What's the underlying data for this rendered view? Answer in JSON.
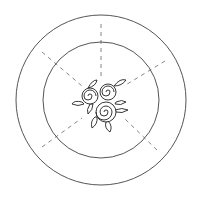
{
  "diagram": {
    "stroke_color": "#555555",
    "rose_stroke_color": "#222222",
    "dash_color": "#777777",
    "background": "#ffffff",
    "center": [
      101,
      100
    ],
    "outer_circle": {
      "radius": 85
    },
    "inner_circle": {
      "radius": 58
    },
    "dashed_lines": [
      {
        "name": "top",
        "x1": 101,
        "y1": 24,
        "x2": 101,
        "y2": 78
      },
      {
        "name": "upper-left",
        "x1": 42,
        "y1": 52,
        "x2": 82,
        "y2": 86
      },
      {
        "name": "upper-right",
        "x1": 165,
        "y1": 61,
        "x2": 124,
        "y2": 86
      },
      {
        "name": "lower-left",
        "x1": 42,
        "y1": 147,
        "x2": 82,
        "y2": 118
      },
      {
        "name": "lower-right",
        "x1": 157,
        "y1": 150,
        "x2": 124,
        "y2": 118
      }
    ],
    "roses": [
      {
        "cx": 90,
        "cy": 96,
        "r": 8
      },
      {
        "cx": 108,
        "cy": 92,
        "r": 8
      },
      {
        "cx": 106,
        "cy": 112,
        "r": 10
      }
    ]
  }
}
